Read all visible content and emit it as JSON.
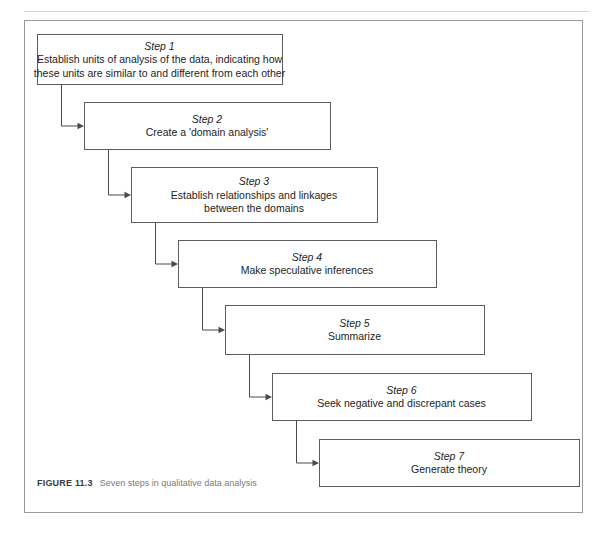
{
  "page": {
    "running_head": ""
  },
  "figure": {
    "caption_label": "FIGURE 11.3",
    "caption_text": "Seven steps in qualitative data analysis",
    "frame_color": "#9a9a9e",
    "box_border_color": "#5d5d61",
    "connector_color": "#4a4a4e",
    "text_color": "#1d1d1f"
  },
  "diagram": {
    "type": "flowchart-cascade",
    "direction": "top-left to bottom-right",
    "step_count": 7,
    "steps": [
      {
        "id": "step-1",
        "title": "Step 1",
        "lines": [
          "Establish units of analysis of the data, indicating how",
          "these units are similar to and different from each other"
        ]
      },
      {
        "id": "step-2",
        "title": "Step 2",
        "lines": [
          "Create a 'domain analysis'"
        ]
      },
      {
        "id": "step-3",
        "title": "Step 3",
        "lines": [
          "Establish relationships and linkages",
          "between the domains"
        ]
      },
      {
        "id": "step-4",
        "title": "Step 4",
        "lines": [
          "Make speculative inferences"
        ]
      },
      {
        "id": "step-5",
        "title": "Step 5",
        "lines": [
          "Summarize"
        ]
      },
      {
        "id": "step-6",
        "title": "Step 6",
        "lines": [
          "Seek negative and discrepant cases"
        ]
      },
      {
        "id": "step-7",
        "title": "Step 7",
        "lines": [
          "Generate theory"
        ]
      }
    ],
    "connections": [
      {
        "from": "step-1",
        "to": "step-2"
      },
      {
        "from": "step-2",
        "to": "step-3"
      },
      {
        "from": "step-3",
        "to": "step-4"
      },
      {
        "from": "step-4",
        "to": "step-5"
      },
      {
        "from": "step-5",
        "to": "step-6"
      },
      {
        "from": "step-6",
        "to": "step-7"
      }
    ]
  },
  "geometry": {
    "boxes": [
      {
        "x": 12,
        "y": 13,
        "w": 245,
        "h": 50
      },
      {
        "x": 59,
        "y": 81,
        "w": 246,
        "h": 47
      },
      {
        "x": 106,
        "y": 146,
        "w": 246,
        "h": 55
      },
      {
        "x": 153,
        "y": 219,
        "w": 258,
        "h": 47
      },
      {
        "x": 200,
        "y": 284,
        "w": 259,
        "h": 49
      },
      {
        "x": 247,
        "y": 352,
        "w": 259,
        "h": 47
      },
      {
        "x": 294,
        "y": 418,
        "w": 260,
        "h": 47
      }
    ],
    "elbow_drop_x_offset": 24
  }
}
